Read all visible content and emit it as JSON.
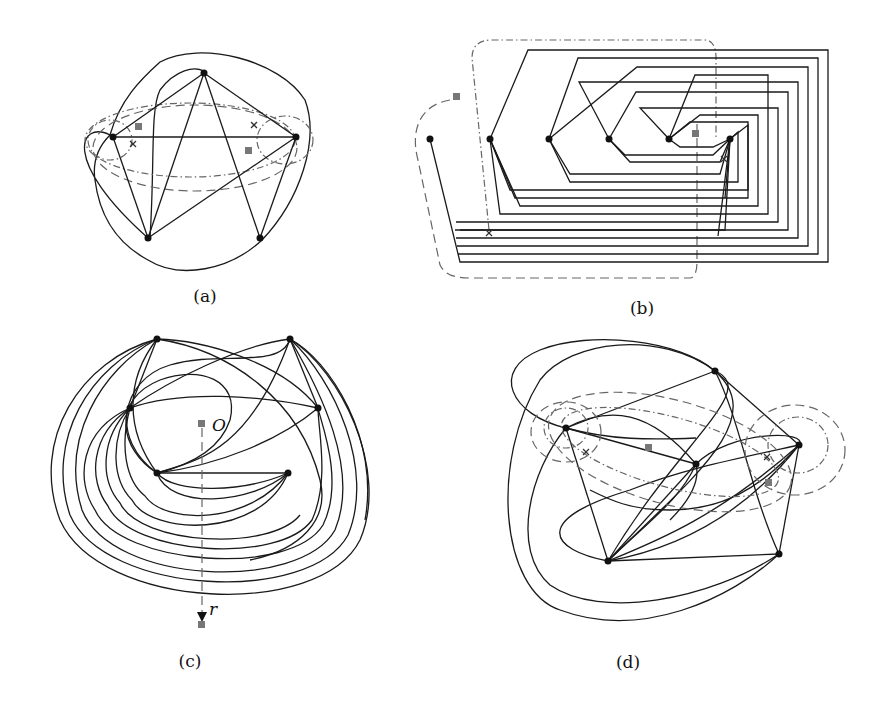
{
  "figure": {
    "panels": [
      {
        "id": "a",
        "caption": "(a)"
      },
      {
        "id": "b",
        "caption": "(b)"
      },
      {
        "id": "c",
        "caption": "(c)",
        "labels": {
          "origin": "O",
          "ray": "r"
        }
      },
      {
        "id": "d",
        "caption": "(d)"
      }
    ]
  },
  "legend_marks": {
    "vertex": "filled-black-circle",
    "special_point": "gray-square",
    "crossing_marker": "x-cross",
    "curves": [
      "solid",
      "dashed",
      "dash-dot"
    ]
  },
  "colors": {
    "edge": "#1a1a1a",
    "vertex": "#111111",
    "marker_square": "#777777",
    "dashed_curve": "#666666",
    "background": "#ffffff"
  }
}
